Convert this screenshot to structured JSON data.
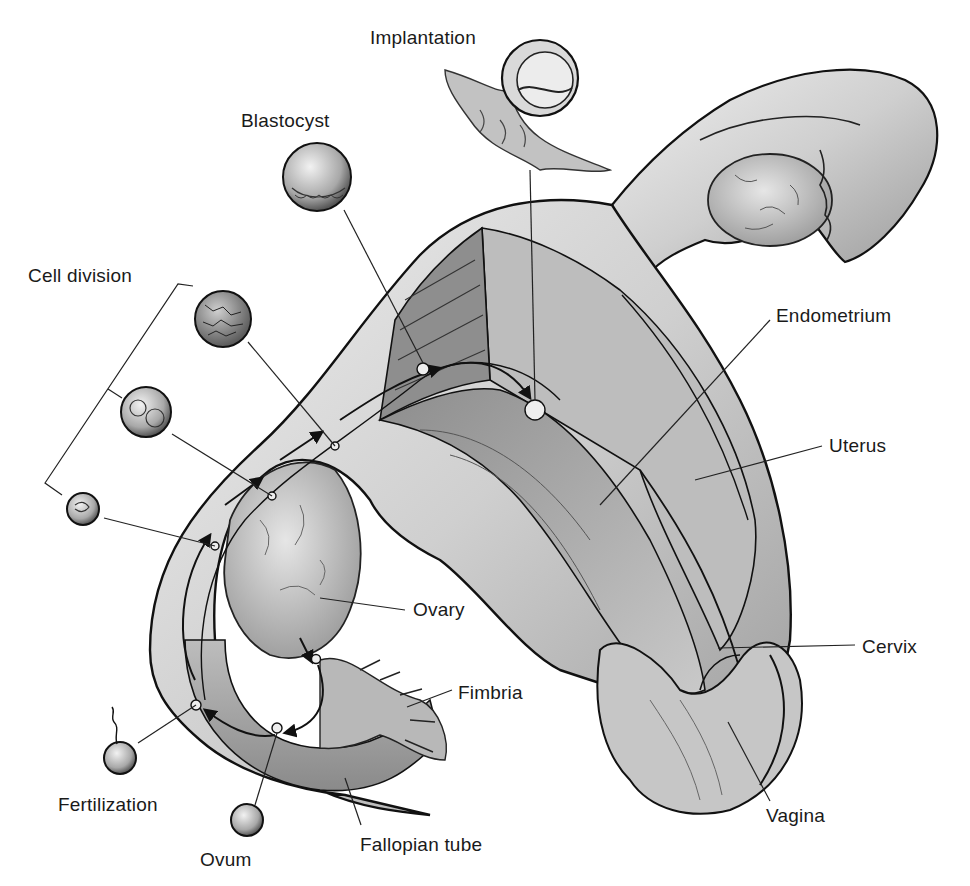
{
  "diagram": {
    "labels": {
      "implantation": "Implantation",
      "blastocyst": "Blastocyst",
      "cell_division": "Cell division",
      "endometrium": "Endometrium",
      "uterus": "Uterus",
      "ovary": "Ovary",
      "cervix": "Cervix",
      "fimbria": "Fimbria",
      "fertilization": "Fertilization",
      "fallopian_tube": "Fallopian tube",
      "vagina": "Vagina",
      "ovum": "Ovum"
    },
    "colors": {
      "ink": "#1a1a1a",
      "tissue_light": "#d8d8d8",
      "tissue_mid": "#a9a9a9",
      "tissue_dark": "#6e6e6e",
      "background": "#ffffff"
    }
  }
}
